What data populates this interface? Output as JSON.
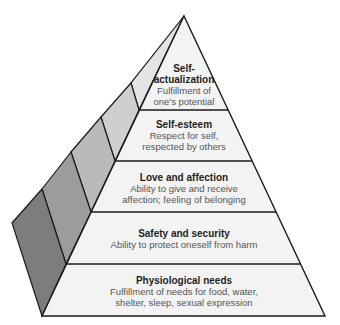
{
  "diagram": {
    "type": "pyramid",
    "colors": {
      "front_face": "#f3f3f3",
      "outline": "#1a1a1a",
      "side_bands": [
        "#e4e4e4",
        "#cfcfcf",
        "#b9b9b9",
        "#9c9c9c",
        "#7d7d7d"
      ]
    },
    "levels": [
      {
        "title": "Self-",
        "title2": "actualization",
        "desc": "Fulfillment of",
        "desc2": "one's potential"
      },
      {
        "title": "Self-esteem",
        "desc": "Respect for self,",
        "desc2": "respected by others"
      },
      {
        "title": "Love and affection",
        "desc": "Ability to give and receive",
        "desc2": "affection; feeling of belonging"
      },
      {
        "title": "Safety and security",
        "desc": "Ability to protect oneself from harm"
      },
      {
        "title": "Physiological needs",
        "desc": "Fulfillment of needs for food, water,",
        "desc2": "shelter, sleep, sexual expression"
      }
    ]
  }
}
